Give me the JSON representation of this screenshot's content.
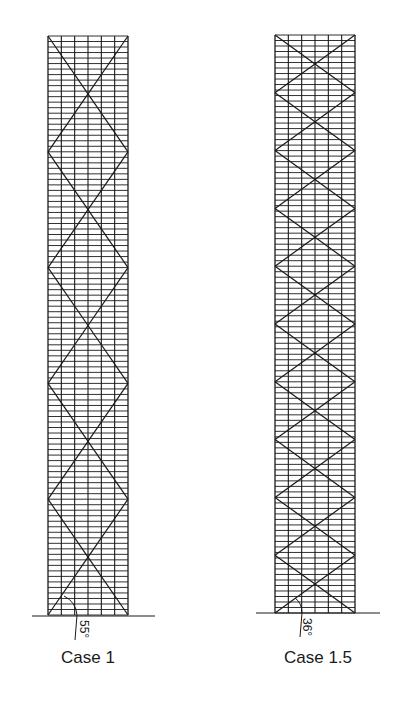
{
  "figure": {
    "background": "#ffffff",
    "line_color": "#1a1a1a",
    "panels": [
      {
        "id": "case-1",
        "caption": "Case 1",
        "angle_label": "55°",
        "x_left": 48,
        "x_right": 128,
        "y_top": 36,
        "y_bottom": 615,
        "bays": 6,
        "floors": 105,
        "diagrid_modules": 5,
        "ground": {
          "x1": 32,
          "x2": 155,
          "y": 616
        },
        "caption_pos": {
          "x": 88,
          "y": 648
        },
        "angle_pos": {
          "x": 91,
          "y": 620
        },
        "arc": {
          "x1": 64,
          "y1": 596,
          "cx": 76,
          "cy": 602,
          "x2": 77,
          "y2": 615
        },
        "leader": {
          "x1": 77,
          "y1": 615,
          "x2": 75,
          "y2": 640
        }
      },
      {
        "id": "case-1-5",
        "caption": "Case 1.5",
        "angle_label": "36°",
        "x_left": 275,
        "x_right": 355,
        "y_top": 35,
        "y_bottom": 613,
        "bays": 6,
        "floors": 105,
        "diagrid_modules": 10,
        "ground": {
          "x1": 256,
          "x2": 380,
          "y": 613
        },
        "caption_pos": {
          "x": 318,
          "y": 648
        },
        "angle_pos": {
          "x": 314,
          "y": 618
        },
        "arc": {
          "x1": 295,
          "y1": 598,
          "cx": 302,
          "cy": 603,
          "x2": 302,
          "y2": 613
        },
        "leader": {
          "x1": 302,
          "y1": 613,
          "x2": 300,
          "y2": 637
        }
      }
    ]
  }
}
